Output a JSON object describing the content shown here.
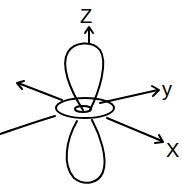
{
  "diagram": {
    "axes": {
      "z_label": "Z",
      "y_label": "y",
      "x_label": "X"
    },
    "stroke_color": "#000000",
    "background": "#ffffff"
  }
}
